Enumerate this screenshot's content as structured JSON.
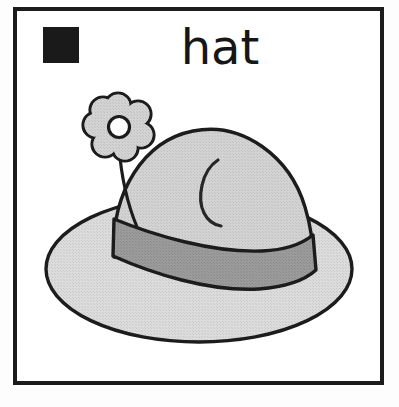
{
  "card": {
    "title": "hat",
    "word_label": "hat",
    "frame_color": "#1c1c1c",
    "background_color": "#ffffff"
  },
  "symbol_swatch": {
    "name": "filled-black-square",
    "color": "#1a1a1a",
    "label": ""
  },
  "illustration": {
    "subject": "hat",
    "description": "A wide-brimmed gray hat with a dark gray band and a flower tucked into the band",
    "parts": [
      {
        "name": "brim",
        "fill": "#d6d6d6",
        "stroke": "#1c1c1c"
      },
      {
        "name": "crown",
        "fill": "#cfcfcf",
        "stroke": "#1c1c1c"
      },
      {
        "name": "hat-band",
        "fill": "#9a9a9a",
        "stroke": "#1c1c1c"
      },
      {
        "name": "crown-crease",
        "fill": "none",
        "stroke": "#262626"
      },
      {
        "name": "flower-petals",
        "fill": "#d2d2d2",
        "stroke": "#1c1c1c",
        "petal_count": 7
      },
      {
        "name": "flower-center",
        "fill": "#ffffff",
        "stroke": "#1c1c1c"
      },
      {
        "name": "flower-stem",
        "fill": "none",
        "stroke": "#1c1c1c"
      }
    ]
  }
}
